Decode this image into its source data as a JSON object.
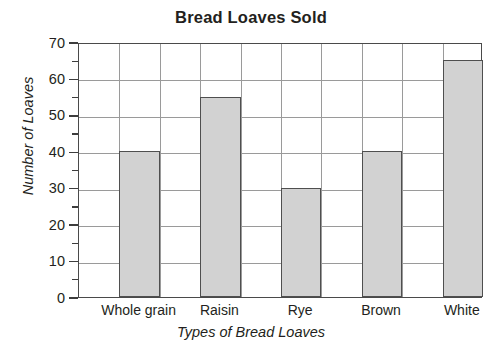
{
  "chart_data": {
    "type": "bar",
    "title": "Bread Loaves Sold",
    "xlabel": "Types of Bread Loaves",
    "ylabel": "Number of Loaves",
    "categories": [
      "Whole grain",
      "Raisin",
      "Rye",
      "Brown",
      "White"
    ],
    "values": [
      40,
      55,
      30,
      40,
      65
    ],
    "ylim": [
      0,
      70
    ],
    "ytick_labels": [
      "0",
      "10",
      "20",
      "30",
      "40",
      "50",
      "60",
      "70"
    ],
    "ytick_values": [
      0,
      10,
      20,
      30,
      40,
      50,
      60,
      70
    ],
    "yminor_tick_values": [
      5,
      15,
      25,
      35,
      45,
      55,
      65
    ],
    "ytick_step": 10,
    "yminor_tick_step": 5,
    "grid": "horizontal-and-vertical",
    "vertical_grid_columns": 10,
    "legend": "none",
    "bar_fill_color": "#d2d2d2",
    "bar_edge_color": "#4f4f4f",
    "grid_color": "#9a9a9a",
    "frame_color": "#4a4a4a",
    "text_color": "#231f20",
    "background_color": "#ffffff"
  }
}
